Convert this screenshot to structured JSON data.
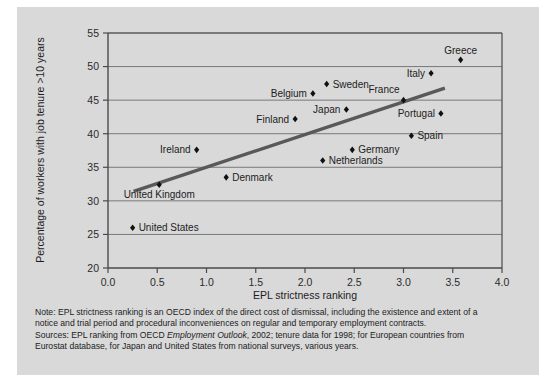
{
  "chart_data": {
    "type": "scatter",
    "title": "",
    "xlabel": "EPL strictness ranking",
    "ylabel": "Percentage of workers with job tenure >10 years",
    "xlim": [
      0.0,
      4.0
    ],
    "ylim": [
      20,
      55
    ],
    "xticks": [
      "0.0",
      "0.5",
      "1.0",
      "1.5",
      "2.0",
      "2.5",
      "3.0",
      "3.5",
      "4.0"
    ],
    "yticks": [
      "20",
      "25",
      "30",
      "35",
      "40",
      "45",
      "50",
      "55"
    ],
    "grid": "horizontal",
    "legend": "none",
    "marker_color": "#111111",
    "trendline_color": "#595959",
    "background_color": "#d9d9d9",
    "points": [
      {
        "label": "United States",
        "x": 0.25,
        "y": 26.0,
        "label_pos": "right"
      },
      {
        "label": "United Kingdom",
        "x": 0.52,
        "y": 32.4,
        "label_pos": "below"
      },
      {
        "label": "Ireland",
        "x": 0.9,
        "y": 37.6,
        "label_pos": "left"
      },
      {
        "label": "Denmark",
        "x": 1.2,
        "y": 33.5,
        "label_pos": "right"
      },
      {
        "label": "Finland",
        "x": 1.9,
        "y": 42.2,
        "label_pos": "left"
      },
      {
        "label": "Belgium",
        "x": 2.08,
        "y": 46.0,
        "label_pos": "left"
      },
      {
        "label": "Sweden",
        "x": 2.22,
        "y": 47.4,
        "label_pos": "right"
      },
      {
        "label": "Netherlands",
        "x": 2.18,
        "y": 36.0,
        "label_pos": "right"
      },
      {
        "label": "Japan",
        "x": 2.42,
        "y": 43.6,
        "label_pos": "left"
      },
      {
        "label": "Germany",
        "x": 2.48,
        "y": 37.6,
        "label_pos": "right"
      },
      {
        "label": "France",
        "x": 3.0,
        "y": 45.0,
        "label_pos": "above-left"
      },
      {
        "label": "Spain",
        "x": 3.08,
        "y": 39.7,
        "label_pos": "right"
      },
      {
        "label": "Italy",
        "x": 3.28,
        "y": 49.0,
        "label_pos": "left"
      },
      {
        "label": "Portugal",
        "x": 3.38,
        "y": 43.0,
        "label_pos": "left"
      },
      {
        "label": "Greece",
        "x": 3.58,
        "y": 51.0,
        "label_pos": "above"
      }
    ],
    "trendline": {
      "x0": 0.26,
      "y0": 31.4,
      "x1": 3.42,
      "y1": 46.8
    }
  },
  "notes": {
    "note_line1": "Note: EPL strictness ranking is an OECD index of the direct cost of dismissal, including the existence and extent of a",
    "note_line2": "notice and trial period and procedural inconveniences on regular and temporary employment contracts.",
    "sources_prefix": "Sources: EPL ranking from OECD ",
    "sources_italic": "Employment Outlook",
    "sources_suffix": ", 2002; tenure data for 1998; for European countries from",
    "sources_line2": "Eurostat database, for Japan and United States from national surveys, various years."
  }
}
